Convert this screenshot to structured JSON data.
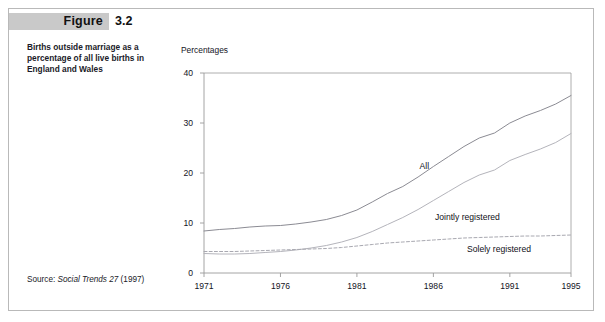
{
  "figure": {
    "label": "Figure",
    "number": "3.2",
    "caption": "Births outside marriage as a percentage of all live births in England and Wales",
    "source_label": "Source: ",
    "source_title": "Social Trends 27",
    "source_year": " (1997)"
  },
  "colors": {
    "header_band": "#c9c9c9",
    "frame_border": "#b9b9b9",
    "axis": "#9a9a9a",
    "text": "#14141e",
    "series_all": "#8b8b93",
    "series_jointly": "#b4b4bb",
    "series_solely": "#a8a8b0"
  },
  "chart_data": {
    "type": "line",
    "title": "",
    "xlabel": "",
    "ylabel": "Percentages",
    "xlim": [
      1971,
      1995
    ],
    "ylim": [
      0,
      40
    ],
    "grid": false,
    "legend": "inline-annotations",
    "xticks": [
      "1971",
      "1976",
      "1981",
      "1986",
      "1991",
      "1995"
    ],
    "xtick_values": [
      1971,
      1976,
      1981,
      1986,
      1991,
      1995
    ],
    "yticks": [
      "0",
      "10",
      "20",
      "30",
      "40"
    ],
    "ytick_values": [
      0,
      10,
      20,
      30,
      40
    ],
    "x": [
      1971,
      1972,
      1973,
      1974,
      1975,
      1976,
      1977,
      1978,
      1979,
      1980,
      1981,
      1982,
      1983,
      1984,
      1985,
      1986,
      1987,
      1988,
      1989,
      1990,
      1991,
      1992,
      1993,
      1994,
      1995
    ],
    "series": [
      {
        "name": "All",
        "style": "solid",
        "values": [
          8.4,
          8.7,
          8.9,
          9.2,
          9.4,
          9.5,
          9.8,
          10.2,
          10.7,
          11.5,
          12.6,
          14.2,
          15.9,
          17.3,
          19.2,
          21.3,
          23.3,
          25.3,
          27.0,
          28.0,
          30.0,
          31.4,
          32.5,
          33.8,
          35.5
        ]
      },
      {
        "name": "Jointly registered",
        "style": "solid",
        "values": [
          3.9,
          3.8,
          3.8,
          3.9,
          4.1,
          4.3,
          4.6,
          5.0,
          5.5,
          6.2,
          7.1,
          8.3,
          9.7,
          11.1,
          12.7,
          14.5,
          16.3,
          18.1,
          19.6,
          20.6,
          22.5,
          23.7,
          24.8,
          26.1,
          27.9
        ]
      },
      {
        "name": "Solely registered",
        "style": "dashed",
        "values": [
          4.3,
          4.3,
          4.3,
          4.4,
          4.5,
          4.6,
          4.7,
          4.8,
          4.9,
          5.1,
          5.4,
          5.7,
          6.0,
          6.2,
          6.4,
          6.6,
          6.8,
          7.0,
          7.1,
          7.2,
          7.3,
          7.4,
          7.4,
          7.5,
          7.6
        ]
      }
    ],
    "annotations": [
      {
        "text": "All",
        "x": 1985.1,
        "y": 21.2
      },
      {
        "text": "Jointly registered",
        "x": 1986.1,
        "y": 11.1
      },
      {
        "text": "Solely registered",
        "x": 1988.2,
        "y": 4.6
      }
    ]
  }
}
